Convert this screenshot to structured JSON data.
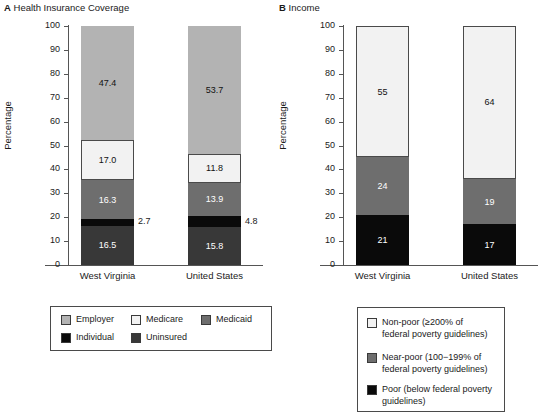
{
  "figure": {
    "background": "#ffffff",
    "width": 550,
    "height": 415
  },
  "panels": [
    {
      "letter": "A",
      "title": "Health Insurance Coverage",
      "ylabel": "Percentage",
      "categories": [
        "West Virginia",
        "United States"
      ],
      "ticks": [
        "0",
        "10",
        "20",
        "30",
        "40",
        "50",
        "60",
        "70",
        "80",
        "90",
        "100"
      ]
    },
    {
      "letter": "B",
      "title": "Income",
      "ylabel": "Percentage",
      "categories": [
        "West Virginia",
        "United States"
      ],
      "ticks": [
        "0",
        "10",
        "20",
        "30",
        "40",
        "50",
        "60",
        "70",
        "80",
        "90",
        "100"
      ]
    }
  ],
  "legend_a": {
    "items": [
      {
        "label": "Employer",
        "color": "#b3b3b3"
      },
      {
        "label": "Medicare",
        "color": "#f2f2f2"
      },
      {
        "label": "Medicaid",
        "color": "#6e6e6e"
      },
      {
        "label": "Individual",
        "color": "#0a0a0a"
      },
      {
        "label": "Uninsured",
        "color": "#383838"
      }
    ]
  },
  "legend_b": {
    "items": [
      {
        "label": "Non-poor (≥200% of\nfederal poverty guidelines)",
        "color": "#f2f2f2"
      },
      {
        "label": "Near-poor (100−199% of\nfederal poverty guidelines)",
        "color": "#6e6e6e"
      },
      {
        "label": "Poor (below federal poverty\nguidelines)",
        "color": "#0a0a0a"
      }
    ]
  },
  "chart_data": [
    {
      "type": "bar",
      "stacked": true,
      "title": "Health Insurance Coverage",
      "panel_letter": "A",
      "xlabel": "",
      "ylabel": "Percentage",
      "ylim": [
        0,
        100
      ],
      "yticks": [
        0,
        10,
        20,
        30,
        40,
        50,
        60,
        70,
        80,
        90,
        100
      ],
      "grid": false,
      "legend_position": "below",
      "categories": [
        "West Virginia",
        "United States"
      ],
      "series": [
        {
          "name": "Uninsured",
          "color": "#383838",
          "values": [
            16.5,
            15.8
          ],
          "labels": [
            "16.5",
            "15.8"
          ],
          "label_inside": true
        },
        {
          "name": "Individual",
          "color": "#0a0a0a",
          "values": [
            2.7,
            4.8
          ],
          "labels": [
            "2.7",
            "4.8"
          ],
          "label_inside": false
        },
        {
          "name": "Medicaid",
          "color": "#6e6e6e",
          "values": [
            16.3,
            13.9
          ],
          "labels": [
            "16.3",
            "13.9"
          ],
          "label_inside": true
        },
        {
          "name": "Medicare",
          "color": "#f2f2f2",
          "values": [
            17.0,
            11.8
          ],
          "labels": [
            "17.0",
            "11.8"
          ],
          "label_inside": true
        },
        {
          "name": "Employer",
          "color": "#b3b3b3",
          "values": [
            47.4,
            53.7
          ],
          "labels": [
            "47.4",
            "53.7"
          ],
          "label_inside": true
        }
      ]
    },
    {
      "type": "bar",
      "stacked": true,
      "title": "Income",
      "panel_letter": "B",
      "xlabel": "",
      "ylabel": "Percentage",
      "ylim": [
        0,
        100
      ],
      "yticks": [
        0,
        10,
        20,
        30,
        40,
        50,
        60,
        70,
        80,
        90,
        100
      ],
      "grid": false,
      "legend_position": "below",
      "categories": [
        "West Virginia",
        "United States"
      ],
      "series": [
        {
          "name": "Poor (below federal poverty guidelines)",
          "color": "#0a0a0a",
          "values": [
            21,
            17
          ],
          "labels": [
            "21",
            "17"
          ],
          "label_inside": true
        },
        {
          "name": "Near-poor (100−199% of federal poverty guidelines)",
          "color": "#6e6e6e",
          "values": [
            24,
            19
          ],
          "labels": [
            "24",
            "19"
          ],
          "label_inside": true
        },
        {
          "name": "Non-poor (≥200% of federal poverty guidelines)",
          "color": "#f2f2f2",
          "values": [
            55,
            64
          ],
          "labels": [
            "55",
            "64"
          ],
          "label_inside": true
        }
      ]
    }
  ]
}
